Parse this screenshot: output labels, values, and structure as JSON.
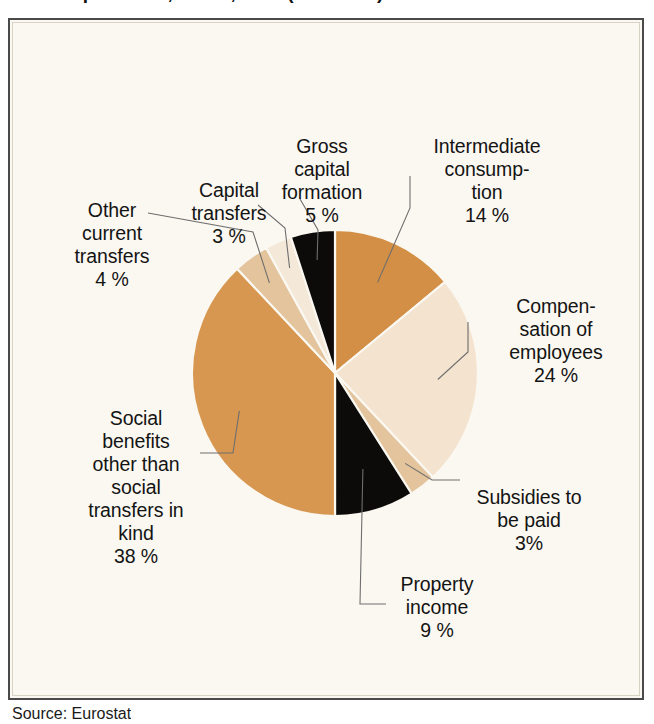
{
  "figure": {
    "title": "Total expenditure, EU-27, 2008 (% of total)",
    "source_note": "Source: Eurostat",
    "panel_background": "#fbf8f1",
    "panel_border": "#4a4a4a"
  },
  "chart_data": {
    "type": "pie",
    "title": "Total expenditure, EU-27, 2008 (% of total)",
    "xlabel": "",
    "ylabel": "",
    "legend_position": "none",
    "grid": false,
    "unit": "%",
    "start_angle_deg": 0,
    "direction": "clockwise",
    "categories": [
      "Intermediate consumption",
      "Compensation of employees",
      "Subsidies to be paid",
      "Property income",
      "Social benefits other than social transfers in kind",
      "Other current transfers",
      "Capital transfers",
      "Gross capital formation"
    ],
    "values": [
      14,
      24,
      3,
      9,
      38,
      4,
      3,
      5
    ],
    "colors": [
      "#d28f45",
      "#f3e3cf",
      "#e3c49d",
      "#0d0b09",
      "#d89750",
      "#e3c49d",
      "#f4e8d8",
      "#0d0b09"
    ],
    "slices": [
      {
        "label": "Intermediate consump-\ntion",
        "value_text": "14 %",
        "value": 14,
        "color": "#d28f45"
      },
      {
        "label": "Compen-\nsation of\nemployees",
        "value_text": "24 %",
        "value": 24,
        "color": "#f3e3cf"
      },
      {
        "label": "Subsidies to\nbe paid",
        "value_text": "3%",
        "value": 3,
        "color": "#e3c49d"
      },
      {
        "label": "Property\nincome",
        "value_text": "9 %",
        "value": 9,
        "color": "#0d0b09"
      },
      {
        "label": "Social\nbenefits\nother than\nsocial\ntransfers in\nkind",
        "value_text": "38 %",
        "value": 38,
        "color": "#d89750"
      },
      {
        "label": "Other\ncurrent\ntransfers",
        "value_text": "4 %",
        "value": 4,
        "color": "#e3c49d"
      },
      {
        "label": "Capital\ntransfers",
        "value_text": "3 %",
        "value": 3,
        "color": "#f4e8d8"
      },
      {
        "label": "Gross\ncapital\nformation",
        "value_text": "5 %",
        "value": 5,
        "color": "#0d0b09"
      }
    ]
  },
  "geometry": {
    "center_x": 335,
    "center_y": 373,
    "radius": 143
  }
}
